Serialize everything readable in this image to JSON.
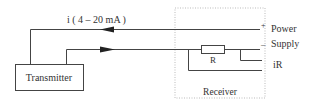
{
  "diagram": {
    "type": "current-loop circuit",
    "colors": {
      "wire": "#444444",
      "text": "#333333",
      "receiver_border": "#bbbbbb",
      "background": "#ffffff"
    },
    "current_label": "i ( 4 – 20 mA )",
    "transmitter": {
      "label": "Transmitter"
    },
    "receiver": {
      "label": "Receiver"
    },
    "resistor": {
      "label": "R"
    },
    "terminals": {
      "plus_sign": "+",
      "minus_sign": "–",
      "power_label": "Power",
      "supply_label": "Supply",
      "ir_label": "iR"
    }
  }
}
